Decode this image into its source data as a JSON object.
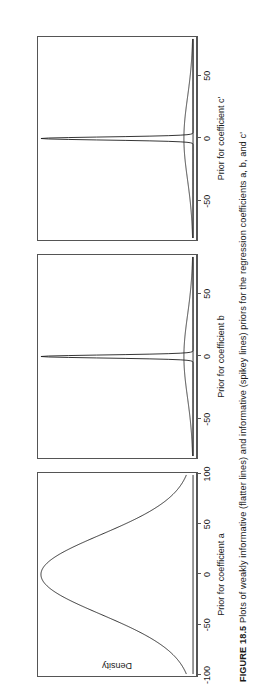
{
  "figure": {
    "caption_label": "FIGURE 18.5",
    "caption_text": "Plots of weakly informative (flatter lines) and informative (spikey lines) priors for the regression coefficients a, b, and c'",
    "caption_full": "FIGURE 18.5 Plots of weakly informative (flatter lines) and informative (spikey lines) priors for the regression coefficients a, b, and c'",
    "ylabel": "Density",
    "orientation": "rotated-90-ccw"
  },
  "chart_data": {
    "type": "line",
    "title": "",
    "ylabel": "Density",
    "grid": false,
    "legend": "none",
    "panel_layout": "1x3",
    "panels": [
      {
        "id": "panel-a",
        "xlabel": "Prior for coefficient a",
        "coefficient": "a",
        "xlim": [
          -100,
          100
        ],
        "xticks": [
          -100,
          -50,
          0,
          50,
          100
        ],
        "xticklabels": [
          "-100",
          "-50",
          "0",
          "50",
          "100"
        ],
        "ylim": [
          0,
          1
        ],
        "series": [
          {
            "name": "weakly informative prior",
            "style": "flatter line",
            "distribution": "normal",
            "mean": 0,
            "sd": 40,
            "peak_density": 1.0
          }
        ]
      },
      {
        "id": "panel-b",
        "xlabel": "Prior for coefficient b",
        "coefficient": "b",
        "xlim": [
          -80,
          80
        ],
        "xticks": [
          -50,
          0,
          50
        ],
        "xticklabels": [
          "-50",
          "0",
          "50"
        ],
        "ylim": [
          0,
          1
        ],
        "series": [
          {
            "name": "weakly informative prior",
            "style": "flatter line",
            "distribution": "normal",
            "mean": 0,
            "sd": 33,
            "peak_density": 0.06
          },
          {
            "name": "informative prior",
            "style": "spikey line",
            "distribution": "normal",
            "mean": 0,
            "sd": 1.2,
            "peak_density": 1.0
          }
        ]
      },
      {
        "id": "panel-c",
        "xlabel": "Prior for coefficient c'",
        "coefficient": "c'",
        "xlim": [
          -80,
          80
        ],
        "xticks": [
          -50,
          0,
          50
        ],
        "xticklabels": [
          "-50",
          "0",
          "50"
        ],
        "ylim": [
          0,
          1
        ],
        "series": [
          {
            "name": "weakly informative prior",
            "style": "flatter line",
            "distribution": "normal",
            "mean": 0,
            "sd": 33,
            "peak_density": 0.06
          },
          {
            "name": "informative prior",
            "style": "spikey line",
            "distribution": "normal",
            "mean": 0,
            "sd": 1.2,
            "peak_density": 1.0
          }
        ]
      }
    ]
  },
  "colors": {
    "background": "#ffffff",
    "line": "#1f1f1f",
    "axis": "#555555",
    "text": "#1a1a1a"
  }
}
